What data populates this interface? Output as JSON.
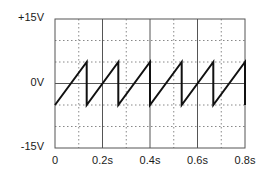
{
  "chart_data": {
    "type": "line",
    "title": "",
    "xlabel": "",
    "ylabel": "",
    "xlim": [
      0,
      0.8
    ],
    "ylim": [
      -15,
      15
    ],
    "grid": true,
    "x_major_ticks": [
      0,
      0.2,
      0.4,
      0.6,
      0.8
    ],
    "x_minor_ticks": [
      0.1,
      0.3,
      0.5,
      0.7
    ],
    "y_grid_lines": [
      -10,
      -5,
      0,
      5,
      10
    ],
    "x_tick_labels": [
      "0",
      "0.2s",
      "0.4s",
      "0.6s",
      "0.8s"
    ],
    "y_tick_labels": [
      "+15V",
      "0V",
      "-15V"
    ],
    "y_tick_values": [
      15,
      0,
      -15
    ],
    "series": [
      {
        "name": "sawtooth",
        "waveform": "sawtooth",
        "amplitude_min": -5,
        "amplitude_max": 5,
        "period": 0.1333,
        "x": [
          0,
          0.1333,
          0.1333,
          0.2667,
          0.2667,
          0.4,
          0.4,
          0.5333,
          0.5333,
          0.6667,
          0.6667,
          0.8,
          0.8
        ],
        "y": [
          -5,
          5,
          -5,
          5,
          -5,
          5,
          -5,
          5,
          -5,
          5,
          -5,
          5,
          -5
        ]
      }
    ]
  }
}
